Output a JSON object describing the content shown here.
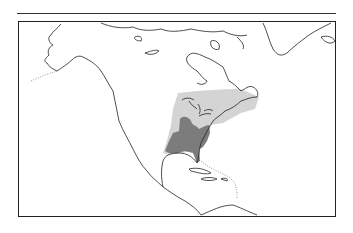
{
  "map": {
    "type": "range-map",
    "region": "North America",
    "legend": [],
    "ranges": [
      {
        "name": "outer-range",
        "color": "#d4d4d4"
      },
      {
        "name": "core-range",
        "color": "#7c7c7c"
      }
    ],
    "colors": {
      "outline": "#222222",
      "background": "#ffffff"
    }
  }
}
